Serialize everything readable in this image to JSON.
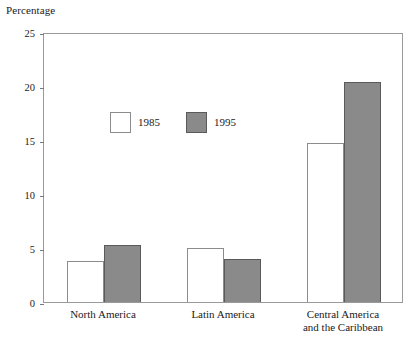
{
  "chart_data": {
    "type": "bar",
    "title": "",
    "subtitle": "",
    "xlabel": "",
    "ylabel": "Percentage",
    "ylim": [
      0,
      25
    ],
    "yticks": [
      0,
      5,
      10,
      15,
      20,
      25
    ],
    "ytick_labels": [
      "0",
      "5",
      "10",
      "15",
      "20",
      "25"
    ],
    "grid": false,
    "frame": true,
    "legend_position": "inside-upper-left",
    "categories": [
      "North America",
      "Latin America",
      "Central America\nand the Caribbean"
    ],
    "series": [
      {
        "name": "1985",
        "color": "#ffffff",
        "edge_color": "#8c8c8c",
        "values": [
          3.8,
          5.0,
          14.7
        ]
      },
      {
        "name": "1995",
        "color": "#8a8a8a",
        "edge_color": "#5a5a5a",
        "values": [
          5.3,
          4.0,
          20.4
        ]
      }
    ]
  },
  "legend": {
    "items": [
      {
        "label": "1985",
        "style": "white"
      },
      {
        "label": "1995",
        "style": "gray"
      }
    ]
  },
  "colors": {
    "series_1985": "#ffffff",
    "series_1995": "#8a8a8a",
    "frame": "#9a9a9a",
    "text": "#1a1a1a"
  }
}
